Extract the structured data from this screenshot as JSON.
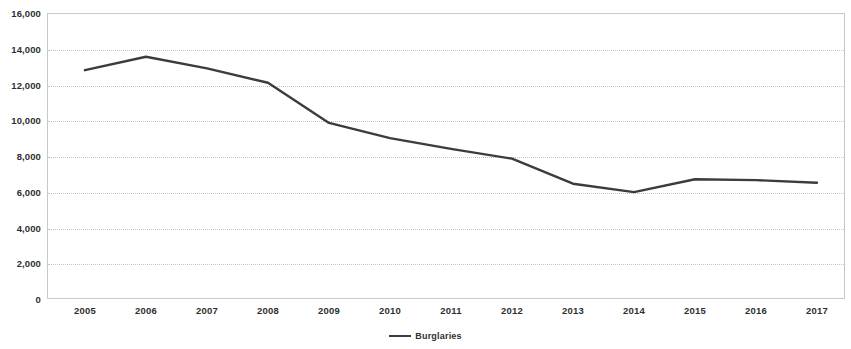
{
  "chart_data": {
    "type": "line",
    "title": "",
    "xlabel": "",
    "ylabel": "",
    "grid": true,
    "legend_position": "bottom",
    "categories": [
      "2005",
      "2006",
      "2007",
      "2008",
      "2009",
      "2010",
      "2011",
      "2012",
      "2013",
      "2014",
      "2015",
      "2016",
      "2017"
    ],
    "x_tick_labels": [
      "2005",
      "2006",
      "2007",
      "2008",
      "2009",
      "2010",
      "2011",
      "2012",
      "2013",
      "2014",
      "2015",
      "2016",
      "2017"
    ],
    "y_tick_labels": [
      "0",
      "2,000",
      "4,000",
      "6,000",
      "8,000",
      "10,000",
      "12,000",
      "14,000",
      "16,000"
    ],
    "y_tick_values": [
      0,
      2000,
      4000,
      6000,
      8000,
      10000,
      12000,
      14000,
      16000
    ],
    "ylim": [
      0,
      16000
    ],
    "series": [
      {
        "name": "Burglaries",
        "color": "#3c3c3c",
        "values": [
          12800,
          13550,
          12900,
          12100,
          9850,
          9000,
          8400,
          7850,
          6450,
          5980,
          6700,
          6650,
          6500
        ]
      }
    ]
  },
  "legend": {
    "entries": [
      {
        "label": "Burglaries",
        "color": "#3c3c3c",
        "marker": "line-swatch"
      }
    ]
  },
  "axes": {
    "y_axis_name": "y-axis",
    "x_axis_name": "x-axis"
  }
}
